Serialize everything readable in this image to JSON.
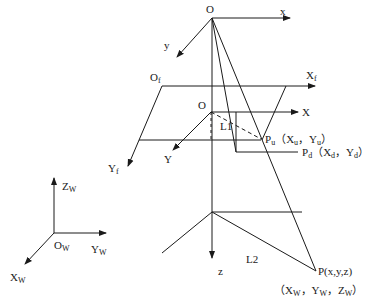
{
  "diagram": {
    "type": "camera-imaging-model",
    "camera_frame": {
      "origin": "O",
      "x": "x",
      "y": "y",
      "z": "z"
    },
    "image_plane": {
      "origin": "O",
      "origin_sub": "f",
      "x": "X",
      "x_sub": "f",
      "y": "Y",
      "y_sub": "f"
    },
    "image_frame": {
      "origin": "O",
      "x": "X",
      "y": "Y"
    },
    "world_frame": {
      "origin": "O",
      "origin_sub": "W",
      "x": "X",
      "x_sub": "W",
      "y": "Y",
      "y_sub": "W",
      "z": "Z",
      "z_sub": "W"
    },
    "points": {
      "pu": {
        "name": "P",
        "name_sub": "u",
        "coords": "（X",
        "c1_sub": "u",
        "sep": "，Y",
        "c2_sub": "u",
        "close": "）"
      },
      "pd": {
        "name": "P",
        "name_sub": "d",
        "coords": "（X",
        "c1_sub": "d",
        "sep": "，Y",
        "c2_sub": "d",
        "close": "）"
      },
      "p": {
        "name": "P(x,y,z)",
        "world_coords_open": "（X",
        "w1": "W",
        "sep1": "，Y",
        "w2": "W",
        "sep2": "，Z",
        "w3": "W",
        "close": "）"
      }
    },
    "lines": {
      "l1": "L1",
      "l2": "L2"
    },
    "colors": {
      "stroke": "#1a1a1a",
      "background": "#ffffff"
    }
  }
}
